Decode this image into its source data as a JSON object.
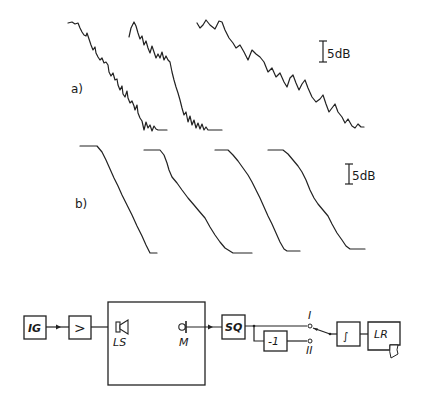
{
  "panel_a": {
    "label": "a)",
    "scale_label": "5dB",
    "curves": [
      {
        "id": "a1",
        "description": "noisy decay curve 1"
      },
      {
        "id": "a2",
        "description": "noisy decay curve 2"
      },
      {
        "id": "a3",
        "description": "noisy decay curve 3 (slower decay)"
      }
    ]
  },
  "panel_b": {
    "label": "b)",
    "scale_label": "5dB",
    "curves": [
      {
        "id": "b1",
        "description": "smooth integrated decay curve 1"
      },
      {
        "id": "b2",
        "description": "smooth integrated decay curve 2"
      },
      {
        "id": "b3",
        "description": "smooth integrated decay curve 3"
      },
      {
        "id": "b4",
        "description": "smooth integrated decay curve 4"
      }
    ]
  },
  "block_diagram": {
    "blocks": {
      "ig": "IG",
      "amp": ">",
      "ls": "LS",
      "m": "M",
      "sq": "SQ",
      "inv": "-1",
      "int": "∫",
      "lr": "LR"
    },
    "switch": {
      "pos1": "I",
      "pos2": "II"
    }
  }
}
